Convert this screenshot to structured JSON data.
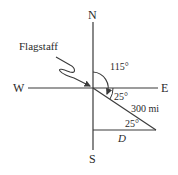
{
  "diagram": {
    "compass": {
      "north": "N",
      "south": "S",
      "east": "E",
      "west": "W"
    },
    "origin_label": "Flagstaff",
    "angles": {
      "bearing": "115°",
      "below_east": "25°",
      "triangle_corner": "25°"
    },
    "distance": "300 mi",
    "unknown": "D",
    "colors": {
      "line": "#3a3a3a",
      "text": "#2a2a2a"
    }
  }
}
